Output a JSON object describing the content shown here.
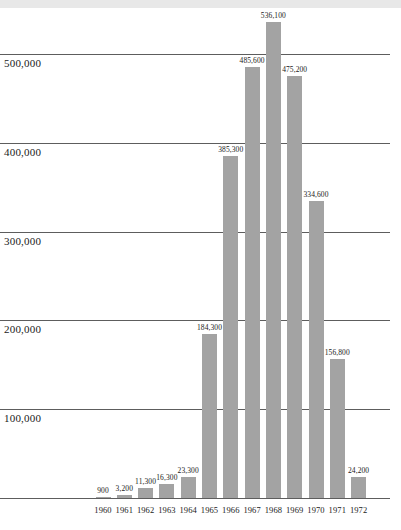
{
  "chart_data": {
    "type": "bar",
    "title": "",
    "subtitle": "",
    "xlabel": "",
    "ylabel": "",
    "categories": [
      "1960",
      "1961",
      "1962",
      "1963",
      "1964",
      "1965",
      "1966",
      "1967",
      "1968",
      "1969",
      "1970",
      "1971",
      "1972"
    ],
    "values": [
      900,
      3200,
      11300,
      16300,
      23300,
      184300,
      385300,
      485600,
      536100,
      475200,
      334600,
      156800,
      24200
    ],
    "value_labels": [
      "900",
      "3,200",
      "11,300",
      "16,300",
      "23,300",
      "184,300",
      "385,300",
      "485,600",
      "536,100",
      "475,200",
      "334,600",
      "156,800",
      "24,200"
    ],
    "ylim": [
      0,
      560000
    ],
    "y_ticks": [
      100000,
      200000,
      300000,
      400000,
      500000
    ],
    "y_tick_labels": [
      "100,000",
      "200,000",
      "300,000",
      "400,000",
      "500,000"
    ],
    "grid": true,
    "legend": null,
    "bar_color": "#a3a3a3",
    "gridline_color": "#5d5d5d",
    "text_color": "#1a1a1a",
    "background_color": "#ffffff",
    "top_band_color": "#e8e8e8"
  }
}
